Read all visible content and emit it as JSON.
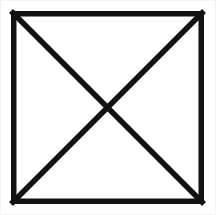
{
  "canvas": {
    "width": 216,
    "height": 215,
    "background_color": "#ffffff",
    "frame_color": "#f2f2f2",
    "description": "Crossed square placeholder graphic"
  },
  "figure": {
    "name": "crossed-square",
    "stroke_color": "#111111",
    "stroke_width": 5.5,
    "fill_color": "#ffffff",
    "square": {
      "left": 11,
      "top": 11,
      "right": 204,
      "bottom": 204,
      "width": 193,
      "height": 193
    },
    "diagonals": [
      {
        "name": "diagonal-top-left-to-bottom-right",
        "x1": 11,
        "y1": 11,
        "x2": 204,
        "y2": 204
      },
      {
        "name": "diagonal-top-right-to-bottom-left",
        "x1": 204,
        "y1": 11,
        "x2": 11,
        "y2": 204
      }
    ],
    "intersection": {
      "x": 107.5,
      "y": 107.5
    },
    "edges": [
      {
        "name": "top-edge",
        "x1": 11,
        "y1": 11,
        "x2": 204,
        "y2": 11
      },
      {
        "name": "right-edge",
        "x1": 204,
        "y1": 11,
        "x2": 204,
        "y2": 204
      },
      {
        "name": "bottom-edge",
        "x1": 11,
        "y1": 204,
        "x2": 204,
        "y2": 204
      },
      {
        "name": "left-edge",
        "x1": 11,
        "y1": 11,
        "x2": 11,
        "y2": 204
      }
    ],
    "corners": [
      {
        "name": "corner-top-left",
        "x": 11,
        "y": 11
      },
      {
        "name": "corner-top-right",
        "x": 204,
        "y": 11
      },
      {
        "name": "corner-bottom-right",
        "x": 204,
        "y": 204
      },
      {
        "name": "corner-bottom-left",
        "x": 11,
        "y": 204
      }
    ]
  }
}
